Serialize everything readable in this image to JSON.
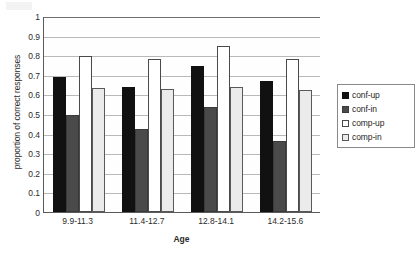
{
  "chart_data": {
    "type": "bar",
    "title": "",
    "xlabel": "Age",
    "ylabel": "proportion of correct responses",
    "categories": [
      "9.9-11.3",
      "11.4-12.7",
      "12.8-14.1",
      "14.2-15.6"
    ],
    "series": [
      {
        "name": "conf-up",
        "color": "#111111",
        "values": [
          0.69,
          0.64,
          0.745,
          0.67
        ]
      },
      {
        "name": "conf-in",
        "color": "#4a4a4a",
        "values": [
          0.495,
          0.425,
          0.535,
          0.36
        ]
      },
      {
        "name": "comp-up",
        "color": "#ffffff",
        "values": [
          0.795,
          0.78,
          0.845,
          0.78
        ]
      },
      {
        "name": "comp-in",
        "color": "#ebebeb",
        "values": [
          0.635,
          0.63,
          0.64,
          0.625
        ]
      }
    ],
    "ylim": [
      0,
      1
    ],
    "ytick_labels": [
      "0",
      "0.1",
      "0.2",
      "0.3",
      "0.4",
      "0.5",
      "0.6",
      "0.7",
      "0.8",
      "0.9",
      "1"
    ],
    "ytick_values": [
      0,
      0.1,
      0.2,
      0.3,
      0.4,
      0.5,
      0.6,
      0.7,
      0.8,
      0.9,
      1
    ],
    "grid": true,
    "legend_position": "right"
  }
}
